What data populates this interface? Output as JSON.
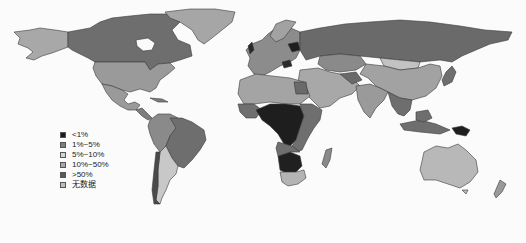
{
  "map": {
    "type": "choropleth-world-map",
    "color_scheme": "grayscale"
  },
  "legend": {
    "items": [
      {
        "label": "<1%",
        "color": "#1a1a1a"
      },
      {
        "label": "1%~5%",
        "color": "#7d7d7d"
      },
      {
        "label": "5%~10%",
        "color": "#d4d4d4"
      },
      {
        "label": "10%~50%",
        "color": "#a6a6a6"
      },
      {
        "label": ">50%",
        "color": "#5a5a5a"
      },
      {
        "label": "无数据",
        "color": "#bdbdbd"
      }
    ]
  },
  "regions": {
    "canada": "#6e6e6e",
    "usa": "#9a9a9a",
    "alaska": "#a8a8a8",
    "greenland": "#a6a6a6",
    "mexico": "#9a9a9a",
    "central_america": "#7d7d7d",
    "brazil": "#6e6e6e",
    "south_america_west": "#8a8a8a",
    "argentina": "#c8c8c8",
    "europe": "#8c8c8c",
    "russia": "#6a6a6a",
    "kazakhstan": "#8a8a8a",
    "mongolia": "#c2c2c2",
    "china": "#a2a2a2",
    "india": "#9a9a9a",
    "middle_east": "#a8a8a8",
    "north_africa": "#a4a4a4",
    "central_africa": "#1e1e1e",
    "east_africa": "#6f6f6f",
    "southern_africa": "#202020",
    "south_africa": "#b4b4b4",
    "southeast_asia": "#6e6e6e",
    "australia": "#b8b8b8",
    "new_zealand": "#9a9a9a",
    "madagascar": "#8a8a8a",
    "japan": "#6e6e6e",
    "papua": "#1e1e1e"
  }
}
